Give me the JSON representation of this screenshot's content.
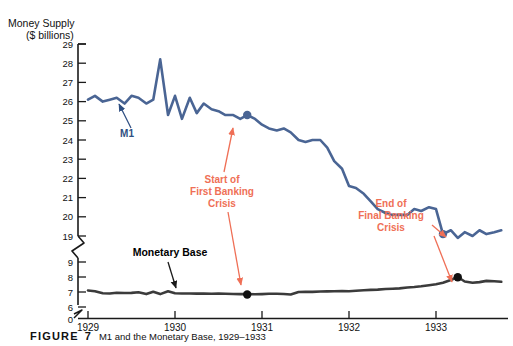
{
  "figure": {
    "caption_label": "FIGURE",
    "caption_number": "7",
    "caption_text": "M1 and the Monetary Base, 1929–1933"
  },
  "colors": {
    "m1_line": "#4a6594",
    "monetary_base_line": "#3b3b3b",
    "annotation": "#ef6f56",
    "axis": "#1a1a1a",
    "background": "#ffffff"
  },
  "chart_data": {
    "type": "line",
    "title": "Money Supply ($ billions)",
    "title_line1": "Money Supply",
    "title_line2": "($ billions)",
    "xlabel": "",
    "ylabel": "Money Supply ($ billions)",
    "grid": false,
    "legend_position": "inline-labels",
    "axis_break": true,
    "y_upper_ticks": [
      29,
      28,
      27,
      26,
      25,
      24,
      23,
      22,
      21,
      20,
      19
    ],
    "y_lower_ticks": [
      9,
      8,
      7,
      6,
      0
    ],
    "y_upper_range": [
      19,
      29
    ],
    "y_lower_range": [
      6,
      9
    ],
    "x_tick_labels": [
      "1929",
      "1930",
      "1931",
      "1932",
      "1933"
    ],
    "x_tick_values": [
      1929,
      1930,
      1931,
      1932,
      1933
    ],
    "xlim": [
      1929,
      1933.75
    ],
    "series": [
      {
        "name": "M1",
        "label": "M1",
        "color": "#4a6594",
        "x": [
          1929.0,
          1929.08,
          1929.17,
          1929.25,
          1929.33,
          1929.42,
          1929.5,
          1929.58,
          1929.67,
          1929.75,
          1929.83,
          1929.92,
          1930.0,
          1930.08,
          1930.17,
          1930.25,
          1930.33,
          1930.42,
          1930.5,
          1930.58,
          1930.67,
          1930.75,
          1930.83,
          1930.92,
          1931.0,
          1931.08,
          1931.17,
          1931.25,
          1931.33,
          1931.42,
          1931.5,
          1931.58,
          1931.67,
          1931.75,
          1931.83,
          1931.92,
          1932.0,
          1932.08,
          1932.17,
          1932.25,
          1932.33,
          1932.42,
          1932.5,
          1932.58,
          1932.67,
          1932.75,
          1932.83,
          1932.92,
          1933.0,
          1933.08,
          1933.17,
          1933.25,
          1933.33,
          1933.42,
          1933.5,
          1933.58,
          1933.67,
          1933.75
        ],
        "values": [
          26.1,
          26.3,
          26.0,
          26.1,
          26.2,
          25.9,
          26.3,
          26.2,
          25.9,
          26.1,
          28.2,
          25.3,
          26.3,
          25.1,
          26.2,
          25.4,
          25.9,
          25.6,
          25.5,
          25.3,
          25.3,
          25.1,
          25.3,
          25.1,
          24.8,
          24.6,
          24.5,
          24.6,
          24.4,
          24.0,
          23.9,
          24.0,
          24.0,
          23.6,
          22.9,
          22.5,
          21.6,
          21.5,
          21.2,
          20.8,
          20.4,
          20.2,
          20.1,
          20.1,
          20.1,
          20.4,
          20.3,
          20.5,
          20.4,
          19.1,
          19.3,
          18.9,
          19.2,
          19.0,
          19.3,
          19.1,
          19.2,
          19.3
        ]
      },
      {
        "name": "Monetary Base",
        "label": "Monetary Base",
        "color": "#3b3b3b",
        "x": [
          1929.0,
          1929.08,
          1929.17,
          1929.25,
          1929.33,
          1929.42,
          1929.5,
          1929.58,
          1929.67,
          1929.75,
          1929.83,
          1929.92,
          1930.0,
          1930.08,
          1930.17,
          1930.25,
          1930.33,
          1930.42,
          1930.5,
          1930.58,
          1930.67,
          1930.75,
          1930.83,
          1930.92,
          1931.0,
          1931.08,
          1931.17,
          1931.25,
          1931.33,
          1931.42,
          1931.5,
          1931.58,
          1931.67,
          1931.75,
          1931.83,
          1931.92,
          1932.0,
          1932.08,
          1932.17,
          1932.25,
          1932.33,
          1932.42,
          1932.5,
          1932.58,
          1932.67,
          1932.75,
          1932.83,
          1932.92,
          1933.0,
          1933.08,
          1933.17,
          1933.25,
          1933.33,
          1933.42,
          1933.5,
          1933.58,
          1933.67,
          1933.75
        ],
        "values": [
          7.1,
          7.05,
          6.92,
          6.9,
          6.95,
          6.93,
          6.94,
          6.98,
          6.86,
          7.02,
          6.86,
          7.05,
          6.92,
          6.9,
          6.9,
          6.89,
          6.89,
          6.88,
          6.89,
          6.88,
          6.87,
          6.86,
          6.86,
          6.85,
          6.86,
          6.88,
          6.88,
          6.87,
          6.83,
          7.0,
          7.02,
          7.01,
          7.03,
          7.04,
          7.05,
          7.06,
          7.05,
          7.08,
          7.12,
          7.14,
          7.16,
          7.2,
          7.22,
          7.24,
          7.3,
          7.33,
          7.38,
          7.45,
          7.52,
          7.62,
          7.8,
          8.0,
          7.7,
          7.62,
          7.66,
          7.74,
          7.72,
          7.68
        ]
      }
    ],
    "markers": [
      {
        "name": "start-first-banking-crisis-m1",
        "series": "M1",
        "x": 1930.83,
        "y": 25.3
      },
      {
        "name": "start-first-banking-crisis-base",
        "series": "Monetary Base",
        "x": 1930.83,
        "y": 6.83
      },
      {
        "name": "end-final-banking-crisis-m1",
        "series": "M1",
        "x": 1933.08,
        "y": 19.1
      },
      {
        "name": "end-final-banking-crisis-base",
        "series": "Monetary Base",
        "x": 1933.25,
        "y": 7.98
      }
    ],
    "annotations": [
      {
        "name": "start-of-first-banking-crisis",
        "lines": [
          "Start of",
          "First Banking",
          "Crisis"
        ],
        "color": "#ef6f56",
        "text_x": 222,
        "text_y": 180
      },
      {
        "name": "end-of-final-banking-crisis",
        "lines": [
          "End of",
          "Final Banking",
          "Crisis"
        ],
        "color": "#ef6f56",
        "text_x": 391,
        "text_y": 204
      }
    ],
    "series_callouts": [
      {
        "name": "m1-callout",
        "label": "M1",
        "color": "#2f4f82",
        "text_x": 127,
        "text_y": 134
      },
      {
        "name": "monetary-base-callout",
        "label": "Monetary Base",
        "color": "#000000",
        "text_x": 170,
        "text_y": 258
      }
    ]
  }
}
